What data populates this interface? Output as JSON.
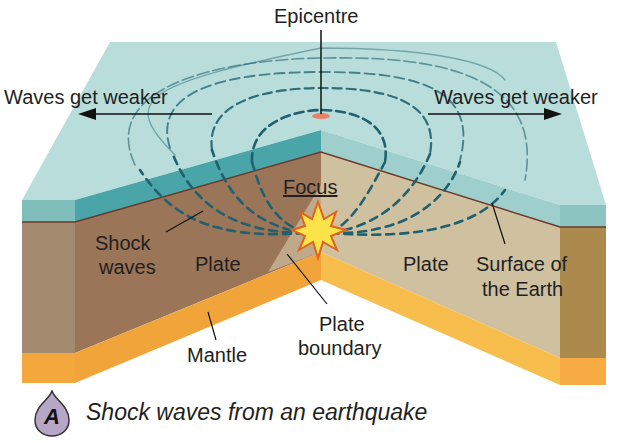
{
  "figure": {
    "badge": "A",
    "caption": "Shock waves from an earthquake"
  },
  "labels": {
    "epicentre": "Epicentre",
    "waves_left": "Waves get weaker",
    "waves_right": "Waves get weaker",
    "focus": "Focus",
    "shock_waves_line1": "Shock",
    "shock_waves_line2": "waves",
    "plate_left": "Plate",
    "plate_right": "Plate",
    "surface_line1": "Surface of",
    "surface_line2": "the Earth",
    "plate_boundary_line1": "Plate",
    "plate_boundary_line2": "boundary",
    "mantle": "Mantle"
  },
  "colors": {
    "surface_top": "#b9ddda",
    "surface_band_left": "#4aa5a8",
    "surface_band_right": "#9fcfcc",
    "plate_left": "#9b7558",
    "plate_left_side": "#a48b70",
    "plate_right": "#cfc0a0",
    "plate_right_side": "#ac8a4e",
    "mantle_left": "#f0a43a",
    "mantle_right": "#f7bd4d",
    "wave_line": "#1f6170",
    "epicentre_mark": "#e8806a",
    "focus_star": "#fde34a",
    "focus_star_edge": "#e0621d",
    "badge_fill": "#b7a6c6"
  }
}
